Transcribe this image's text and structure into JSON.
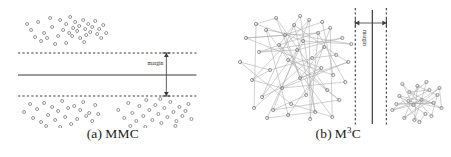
{
  "figure": {
    "background_color": "#ffffff",
    "point_color": "#8a8a8a",
    "line_color": "#3a3a3a",
    "edge_color": "#a8a8a8"
  },
  "panels": [
    {
      "id": "panel-a",
      "caption_letter": "(a)",
      "caption_text": "MMC",
      "caption_sup": "",
      "margin_label": "margin",
      "orientation": "horizontal",
      "decision_boundary": {
        "type": "line",
        "y": 75,
        "x1": 18,
        "x2": 196
      },
      "margin_lines": [
        {
          "name": "upper-margin-line",
          "y": 53,
          "x1": 18,
          "x2": 196,
          "style": "dashed"
        },
        {
          "name": "lower-margin-line",
          "y": 96,
          "x1": 18,
          "x2": 196,
          "style": "dashed"
        }
      ],
      "margin_arrow": {
        "x": 166,
        "y1": 53,
        "y2": 96
      },
      "clusters": [
        {
          "name": "upper-cluster",
          "points": [
            [
              31,
              30
            ],
            [
              38,
              22
            ],
            [
              44,
              33
            ],
            [
              50,
              18
            ],
            [
              52,
              27
            ],
            [
              58,
              36
            ],
            [
              41,
              41
            ],
            [
              47,
              38
            ],
            [
              60,
              20
            ],
            [
              63,
              30
            ],
            [
              66,
              24
            ],
            [
              69,
              33
            ],
            [
              70,
              17
            ],
            [
              73,
              28
            ],
            [
              72,
              36
            ],
            [
              75,
              22
            ],
            [
              77,
              31
            ],
            [
              79,
              26
            ],
            [
              80,
              38
            ],
            [
              83,
              20
            ],
            [
              85,
              29
            ],
            [
              86,
              35
            ],
            [
              88,
              24
            ],
            [
              90,
              32
            ],
            [
              92,
              27
            ],
            [
              95,
              21
            ],
            [
              97,
              34
            ],
            [
              99,
              29
            ],
            [
              101,
              38
            ],
            [
              55,
              44
            ],
            [
              66,
              43
            ],
            [
              84,
              42
            ],
            [
              103,
              25
            ],
            [
              106,
              33
            ],
            [
              35,
              37
            ],
            [
              27,
              24
            ]
          ]
        },
        {
          "name": "lower-left-cluster",
          "points": [
            [
              24,
              112
            ],
            [
              30,
              104
            ],
            [
              33,
              118
            ],
            [
              37,
              109
            ],
            [
              41,
              122
            ],
            [
              44,
              103
            ],
            [
              48,
              115
            ],
            [
              52,
              107
            ],
            [
              55,
              120
            ],
            [
              58,
              111
            ],
            [
              62,
              101
            ],
            [
              65,
              117
            ],
            [
              68,
              108
            ],
            [
              71,
              124
            ],
            [
              74,
              106
            ],
            [
              77,
              119
            ],
            [
              80,
              110
            ],
            [
              83,
              102
            ],
            [
              86,
              116
            ],
            [
              89,
              113
            ],
            [
              92,
              121
            ],
            [
              95,
              105
            ],
            [
              98,
              114
            ],
            [
              46,
              126
            ],
            [
              60,
              127
            ]
          ]
        },
        {
          "name": "lower-right-cluster",
          "points": [
            [
              118,
              110
            ],
            [
              124,
              118
            ],
            [
              128,
              103
            ],
            [
              132,
              113
            ],
            [
              136,
              121
            ],
            [
              139,
              106
            ],
            [
              143,
              116
            ],
            [
              146,
              100
            ],
            [
              149,
              110
            ],
            [
              152,
              120
            ],
            [
              155,
              105
            ],
            [
              158,
              114
            ],
            [
              161,
              123
            ],
            [
              164,
              108
            ],
            [
              167,
              117
            ],
            [
              170,
              102
            ],
            [
              173,
              112
            ],
            [
              176,
              121
            ],
            [
              179,
              107
            ],
            [
              182,
              116
            ],
            [
              185,
              111
            ],
            [
              188,
              104
            ],
            [
              191,
              119
            ],
            [
              130,
              126
            ],
            [
              145,
              127
            ],
            [
              160,
              99
            ],
            [
              175,
              126
            ]
          ]
        }
      ]
    },
    {
      "id": "panel-b",
      "caption_letter": "(b)",
      "caption_text": "M",
      "caption_sup": "3",
      "caption_tail": "C",
      "margin_label": "margin",
      "orientation": "vertical",
      "decision_boundary": {
        "type": "line",
        "x": 146,
        "y1": 10,
        "y2": 124
      },
      "margin_lines": [
        {
          "name": "left-margin-line",
          "x": 129,
          "y1": 8,
          "y2": 126,
          "style": "dashed"
        },
        {
          "name": "right-margin-line",
          "x": 160,
          "y1": 8,
          "y2": 126,
          "style": "dashed"
        }
      ],
      "margin_arrow": {
        "y": 23,
        "x1": 129,
        "x2": 160
      },
      "clusters": [
        {
          "name": "left-graph-cluster",
          "nodes": [
            [
              14,
              62
            ],
            [
              20,
              38
            ],
            [
              26,
              80
            ],
            [
              30,
              24
            ],
            [
              33,
              52
            ],
            [
              36,
              97
            ],
            [
              40,
              30
            ],
            [
              44,
              70
            ],
            [
              47,
              110
            ],
            [
              50,
              18
            ],
            [
              53,
              45
            ],
            [
              56,
              88
            ],
            [
              59,
              35
            ],
            [
              62,
              60
            ],
            [
              65,
              104
            ],
            [
              68,
              25
            ],
            [
              71,
              50
            ],
            [
              74,
              78
            ],
            [
              77,
              41
            ],
            [
              80,
              95
            ],
            [
              83,
              20
            ],
            [
              86,
              58
            ],
            [
              89,
              112
            ],
            [
              92,
              33
            ],
            [
              95,
              68
            ],
            [
              98,
              47
            ],
            [
              101,
              90
            ],
            [
              104,
              28
            ],
            [
              107,
              75
            ],
            [
              110,
              55
            ],
            [
              113,
              100
            ],
            [
              116,
              38
            ],
            [
              119,
              82
            ],
            [
              122,
              62
            ],
            [
              125,
              44
            ],
            [
              106,
              117
            ],
            [
              84,
              119
            ],
            [
              62,
              115
            ],
            [
              41,
              118
            ],
            [
              28,
              108
            ],
            [
              96,
              22
            ],
            [
              74,
              16
            ]
          ],
          "edges": [
            [
              0,
              7
            ],
            [
              1,
              12
            ],
            [
              2,
              20
            ],
            [
              3,
              9
            ],
            [
              4,
              16
            ],
            [
              5,
              24
            ],
            [
              6,
              13
            ],
            [
              7,
              21
            ],
            [
              8,
              30
            ],
            [
              9,
              17
            ],
            [
              10,
              26
            ],
            [
              11,
              33
            ],
            [
              12,
              19
            ],
            [
              13,
              28
            ],
            [
              14,
              35
            ],
            [
              15,
              22
            ],
            [
              16,
              31
            ],
            [
              17,
              25
            ],
            [
              18,
              34
            ],
            [
              19,
              27
            ],
            [
              20,
              36
            ],
            [
              21,
              29
            ],
            [
              22,
              38
            ],
            [
              23,
              32
            ],
            [
              24,
              37
            ],
            [
              25,
              39
            ],
            [
              26,
              30
            ],
            [
              27,
              35
            ],
            [
              28,
              40
            ],
            [
              29,
              33
            ],
            [
              0,
              14
            ],
            [
              1,
              23
            ],
            [
              2,
              11
            ],
            [
              3,
              18
            ],
            [
              4,
              27
            ],
            [
              5,
              15
            ],
            [
              6,
              34
            ],
            [
              7,
              2
            ],
            [
              8,
              19
            ],
            [
              10,
              41
            ],
            [
              12,
              40
            ],
            [
              16,
              5
            ],
            [
              20,
              8
            ],
            [
              24,
              1
            ],
            [
              31,
              4
            ],
            [
              35,
              10
            ],
            [
              37,
              6
            ],
            [
              39,
              3
            ],
            [
              41,
              22
            ],
            [
              33,
              17
            ],
            [
              30,
              13
            ],
            [
              26,
              9
            ],
            [
              23,
              36
            ],
            [
              18,
              38
            ],
            [
              15,
              29
            ],
            [
              11,
              32
            ]
          ]
        },
        {
          "name": "right-graph-cluster",
          "nodes": [
            [
              166,
              110
            ],
            [
              173,
              96
            ],
            [
              178,
              118
            ],
            [
              183,
              92
            ],
            [
              187,
              105
            ],
            [
              191,
              86
            ],
            [
              195,
              100
            ],
            [
              199,
              114
            ],
            [
              203,
              90
            ],
            [
              207,
              103
            ],
            [
              211,
              95
            ],
            [
              215,
              108
            ],
            [
              176,
              84
            ],
            [
              188,
              120
            ],
            [
              200,
              82
            ],
            [
              193,
              122
            ],
            [
              182,
              101
            ],
            [
              170,
              104
            ],
            [
              205,
              116
            ],
            [
              213,
              88
            ]
          ],
          "edges": [
            [
              0,
              6
            ],
            [
              1,
              9
            ],
            [
              2,
              10
            ],
            [
              3,
              11
            ],
            [
              4,
              12
            ],
            [
              5,
              13
            ],
            [
              6,
              14
            ],
            [
              7,
              15
            ],
            [
              8,
              16
            ],
            [
              9,
              17
            ],
            [
              10,
              18
            ],
            [
              11,
              19
            ],
            [
              0,
              4
            ],
            [
              1,
              7
            ],
            [
              2,
              5
            ],
            [
              3,
              8
            ],
            [
              12,
              18
            ],
            [
              14,
              0
            ],
            [
              16,
              11
            ],
            [
              17,
              9
            ],
            [
              19,
              2
            ],
            [
              13,
              6
            ],
            [
              15,
              1
            ],
            [
              5,
              10
            ],
            [
              4,
              19
            ]
          ]
        }
      ]
    }
  ]
}
